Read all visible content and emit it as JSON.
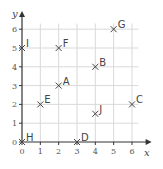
{
  "chart_data": {
    "type": "scatter",
    "title": "",
    "xlabel": "x",
    "ylabel": "y",
    "xlim": [
      0,
      6
    ],
    "ylim": [
      0,
      6
    ],
    "grid": true,
    "x_ticks": [
      "0",
      "1",
      "2",
      "3",
      "4",
      "5",
      "6"
    ],
    "y_ticks": [
      "0",
      "1",
      "2",
      "3",
      "4",
      "5",
      "6"
    ],
    "marker": "x",
    "points": [
      {
        "label": "A",
        "x": 2,
        "y": 3
      },
      {
        "label": "B",
        "x": 4,
        "y": 4
      },
      {
        "label": "C",
        "x": 6,
        "y": 2
      },
      {
        "label": "D",
        "x": 3,
        "y": 0
      },
      {
        "label": "E",
        "x": 1,
        "y": 2
      },
      {
        "label": "F",
        "x": 2,
        "y": 5
      },
      {
        "label": "G",
        "x": 5,
        "y": 6
      },
      {
        "label": "H",
        "x": 0,
        "y": 0
      },
      {
        "label": "I",
        "x": 0,
        "y": 5
      },
      {
        "label": "J",
        "x": 4,
        "y": 1.5
      }
    ]
  },
  "colors": {
    "grid": "#d9d9d9",
    "axis": "#333333",
    "marker": "#444444",
    "text": "#444444"
  }
}
